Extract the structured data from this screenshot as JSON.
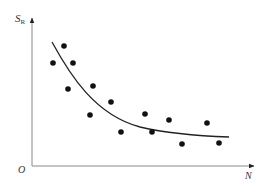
{
  "chart_data": {
    "type": "scatter",
    "title": "",
    "xlabel": "N",
    "ylabel": "S",
    "ylabel_subscript": "R",
    "origin_label": "O",
    "grid": false,
    "legend": null,
    "ticks": "none",
    "series": [
      {
        "name": "observations",
        "kind": "scatter",
        "points_px": [
          [
            64,
            46
          ],
          [
            53,
            63
          ],
          [
            73,
            63
          ],
          [
            68,
            89
          ],
          [
            93,
            86
          ],
          [
            111,
            102
          ],
          [
            90,
            115
          ],
          [
            121,
            132
          ],
          [
            145,
            114
          ],
          [
            169,
            120
          ],
          [
            207,
            123
          ],
          [
            152,
            132
          ],
          [
            182,
            144
          ],
          [
            219,
            143
          ]
        ]
      },
      {
        "name": "trend",
        "kind": "line",
        "description": "decreasing convex curve",
        "path_px": "M52,42 C70,75 95,115 140,127 C170,134 200,136 229,137"
      }
    ]
  },
  "colors": {
    "axis": "#888888",
    "points": "#111111",
    "curve": "#222222"
  }
}
